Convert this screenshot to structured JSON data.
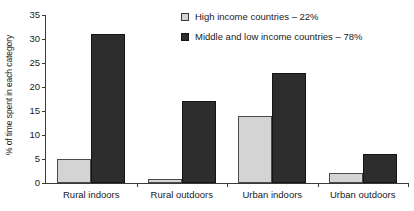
{
  "chart_data": {
    "type": "bar",
    "title": "",
    "subtitle": "",
    "xlabel": "",
    "ylabel": "% of time spent in each category",
    "ylim": [
      0,
      35
    ],
    "ytick_values": [
      0,
      5,
      10,
      15,
      20,
      25,
      30,
      35
    ],
    "ytick_labels": [
      "0",
      "5",
      "10",
      "15",
      "20",
      "25",
      "30",
      "35"
    ],
    "grid": false,
    "legend_position": "top-right",
    "categories": [
      "Rural indoors",
      "Rural outdoors",
      "Urban indoors",
      "Urban outdoors"
    ],
    "series": [
      {
        "name": "High income countries – 22%",
        "color": "#d4d4d4",
        "values": [
          5,
          0.8,
          14,
          2
        ]
      },
      {
        "name": "Middle and low income countries – 78%",
        "color": "#2d2d2d",
        "values": [
          31,
          17,
          23,
          6
        ]
      }
    ]
  },
  "legend": {
    "entries": [
      {
        "label": "High income countries – 22%",
        "swatch": "light-square-swatch"
      },
      {
        "label": "Middle and low income countries – 78%",
        "swatch": "dark-square-swatch"
      }
    ]
  },
  "colors": {
    "light_bar_fill": "#d4d4d4",
    "light_bar_stroke": "#4a4a4a",
    "dark_bar_fill": "#2d2d2d",
    "dark_bar_stroke": "#141414",
    "axis": "#3a3a3a",
    "text": "#1a1a1a",
    "background": "#ffffff"
  }
}
